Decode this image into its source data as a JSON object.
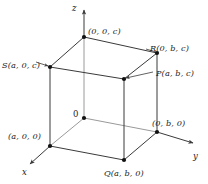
{
  "figure": {
    "colors": {
      "stroke": "#3a3a3a",
      "vertex": "#111111",
      "text": "#1a1a1a",
      "background": "#ffffff"
    },
    "axes": [
      {
        "name": "z-axis",
        "label": "z",
        "x": 72,
        "y": 4
      },
      {
        "name": "y-axis",
        "label": "y",
        "x": 193,
        "y": 152
      },
      {
        "name": "x-axis",
        "label": "x",
        "x": 22,
        "y": 168
      }
    ],
    "vertices": [
      {
        "name": "top-back",
        "label": "(0, 0, c)",
        "px": 84,
        "py": 37,
        "lx": 88,
        "ly": 27
      },
      {
        "name": "point-R",
        "label": "R(0, b, c)",
        "px": 157,
        "py": 53,
        "lx": 150,
        "ly": 44
      },
      {
        "name": "point-S",
        "label": "S(a, 0, c)",
        "px": 50,
        "py": 67,
        "lx": 2,
        "ly": 61
      },
      {
        "name": "point-P",
        "label": "P(a, b, c)",
        "px": 124,
        "py": 79,
        "lx": 156,
        "ly": 69
      },
      {
        "name": "origin",
        "label": "0",
        "px": 84,
        "py": 118,
        "lx": 73,
        "ly": 110
      },
      {
        "name": "y-intercept",
        "label": "(0, b, 0)",
        "px": 157,
        "py": 132,
        "lx": 152,
        "ly": 119
      },
      {
        "name": "x-intercept",
        "label": "(a, 0, 0)",
        "px": 50,
        "py": 146,
        "lx": 8,
        "ly": 132
      },
      {
        "name": "point-Q",
        "label": "Q(a, b, 0)",
        "px": 124,
        "py": 160,
        "lx": 104,
        "ly": 169
      }
    ]
  }
}
